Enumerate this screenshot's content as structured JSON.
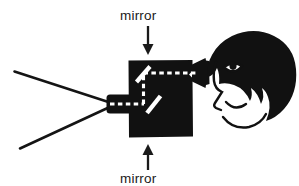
{
  "figure": {
    "background_color": "#ffffff",
    "ink_color": "#111111",
    "ray_color": "#ffffff"
  },
  "labels": {
    "top_mirror": "mirror",
    "bottom_mirror": "mirror"
  },
  "annotations": {
    "top_arrow": "arrow-down-to-upper-mirror",
    "bottom_arrow": "arrow-up-to-lower-mirror"
  },
  "parts": {
    "body": "periscope-body-box",
    "objective_lens": "objective-lens-snout",
    "eyepiece": "eyepiece-cone",
    "upper_mirror": "upper-mirror-stroke",
    "lower_mirror": "lower-mirror-stroke",
    "ray_horizontal": "light-ray-horizontal-dashed",
    "ray_vertical": "light-ray-vertical-dashed",
    "ray_entry": "light-ray-entry-dashed",
    "fov_upper": "field-of-view-upper-line",
    "fov_lower": "field-of-view-lower-line",
    "head": "observer-head-profile",
    "hair": "observer-hair",
    "eye": "observer-eye",
    "pupil": "observer-pupil",
    "mouth": "observer-mouth",
    "chin": "observer-chin-line"
  }
}
